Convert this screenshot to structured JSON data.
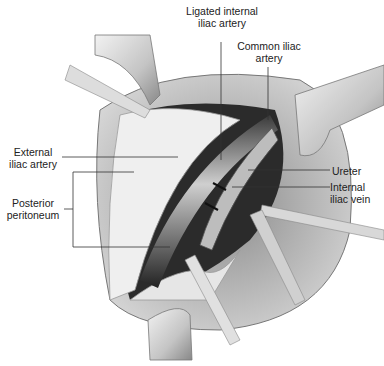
{
  "figure": {
    "labels": {
      "ligated_internal_iliac_artery": "Ligated internal\niliac artery",
      "common_iliac_artery": "Common iliac\nartery",
      "external_iliac_artery": "External\niliac artery",
      "posterior_peritoneum": "Posterior\nperitoneum",
      "ureter": "Ureter",
      "internal_iliac_vein": "Internal\niliac vein"
    }
  }
}
